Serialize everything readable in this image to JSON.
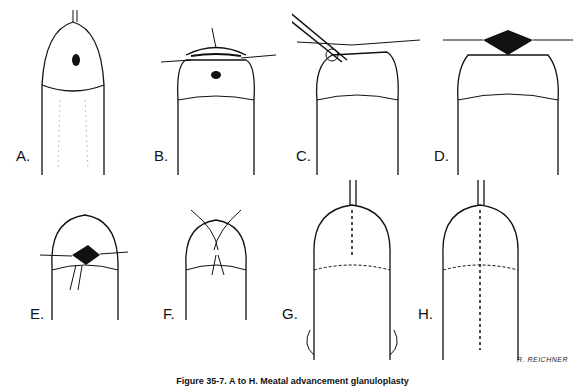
{
  "figure": {
    "caption": "Figure 35-7. A to H. Meatal advancement glanuloplasty",
    "signature": "R. REICHNER",
    "panels": [
      {
        "label": "A.",
        "step": "initial view"
      },
      {
        "label": "B.",
        "step": "traction sutures placed"
      },
      {
        "label": "C.",
        "step": "incision with instrument"
      },
      {
        "label": "D.",
        "step": "opening exposed"
      },
      {
        "label": "E.",
        "step": "advancement"
      },
      {
        "label": "F.",
        "step": "suturing"
      },
      {
        "label": "G.",
        "step": "closure"
      },
      {
        "label": "H.",
        "step": "completed repair"
      }
    ]
  }
}
